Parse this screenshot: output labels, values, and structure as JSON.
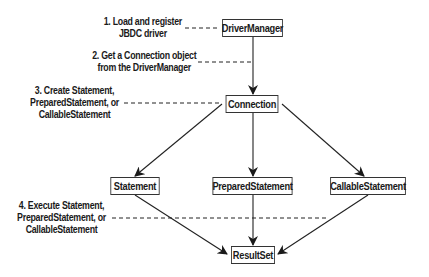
{
  "diagram": {
    "type": "flowchart",
    "nodes": [
      {
        "id": "driver_manager",
        "label": "DriverManager"
      },
      {
        "id": "connection",
        "label": "Connection"
      },
      {
        "id": "statement",
        "label": "Statement"
      },
      {
        "id": "prepared_statement",
        "label": "PreparedStatement"
      },
      {
        "id": "callable_statement",
        "label": "CallableStatement"
      },
      {
        "id": "result_set",
        "label": "ResultSet"
      }
    ],
    "edges": [
      {
        "from": "driver_manager",
        "to": "connection"
      },
      {
        "from": "connection",
        "to": "statement"
      },
      {
        "from": "connection",
        "to": "prepared_statement"
      },
      {
        "from": "connection",
        "to": "callable_statement"
      },
      {
        "from": "statement",
        "to": "result_set"
      },
      {
        "from": "prepared_statement",
        "to": "result_set"
      },
      {
        "from": "callable_statement",
        "to": "result_set"
      }
    ],
    "steps": [
      {
        "lines": [
          "1. Load and register",
          "JBDC driver"
        ]
      },
      {
        "lines": [
          "2. Get a Connection object",
          "from the DriverManager"
        ]
      },
      {
        "lines": [
          "3. Create Statement,",
          "PreparedStatement, or",
          "CallableStatement"
        ]
      },
      {
        "lines": [
          "4. Execute Statement,",
          "PreparedStatement, or",
          "CallableStatement"
        ]
      }
    ]
  },
  "colors": {
    "line": "#222222",
    "box_border": "#333333",
    "background": "#ffffff"
  }
}
